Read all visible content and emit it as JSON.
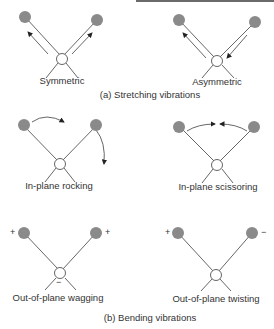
{
  "figure": {
    "section_a": {
      "caption": "(a)  Stretching vibrations",
      "modes": [
        {
          "label": "Symmetric"
        },
        {
          "label": "Asymmetric"
        }
      ]
    },
    "section_b": {
      "caption": "(b)  Bending vibrations",
      "modes": [
        {
          "label": "In-plane rocking"
        },
        {
          "label": "In-plane scissoring"
        },
        {
          "label": "Out-of-plane wagging",
          "signs": {
            "left": "+",
            "right": "+",
            "center": "−"
          }
        },
        {
          "label": "Out-of-plane twisting",
          "signs": {
            "left": "+",
            "right": "−"
          }
        }
      ]
    },
    "colors": {
      "atom": "#8a8a8a",
      "bond": "#555555",
      "center_atom_fill": "#ffffff"
    }
  }
}
